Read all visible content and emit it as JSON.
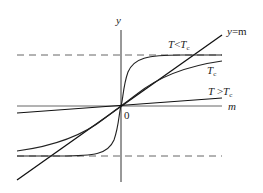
{
  "diagram": {
    "title": "",
    "axes": {
      "x_label": "m",
      "y_label": "y",
      "origin_label": "0"
    },
    "curves": [
      {
        "id": "line-y-eq-m",
        "label_main": "y",
        "label_rest": "=m"
      },
      {
        "id": "curve-t-less-tc",
        "label_main": "T",
        "label_op": "<",
        "label_sub_main": "T",
        "label_sub": "c"
      },
      {
        "id": "curve-t-eq-tc",
        "label_main": "T",
        "label_sub": "c"
      },
      {
        "id": "curve-t-greater-tc",
        "label_main": "T",
        "label_op": " >",
        "label_sub_main": "T",
        "label_sub": "c"
      }
    ],
    "asymptotes": [
      {
        "id": "upper-saturation",
        "style": "dashed"
      },
      {
        "id": "lower-saturation",
        "style": "dashed"
      }
    ],
    "colors": {
      "stroke": "#1a1a1a",
      "axis": "#333333",
      "dashed": "#555555",
      "background": "#ffffff"
    }
  }
}
